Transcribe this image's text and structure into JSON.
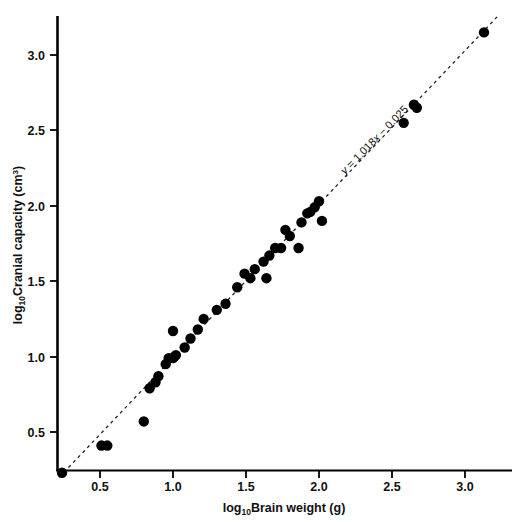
{
  "chart_data": {
    "type": "scatter",
    "title": "",
    "subtitle": "",
    "xlabel": "log10 Brain weight (g)",
    "xlabel_base": "log",
    "xlabel_sub": "10",
    "xlabel_rest": "Brain weight (g)",
    "ylabel": "log10 Cranial capacity (cm3)",
    "ylabel_base": "log",
    "ylabel_sub": "10",
    "ylabel_rest": "Cranial capacity (cm",
    "ylabel_sup": "3",
    "ylabel_tail": ")",
    "xlim": [
      0.2,
      3.25
    ],
    "ylim": [
      0.2,
      3.25
    ],
    "xticks": [
      0.5,
      1.0,
      1.5,
      2.0,
      2.5,
      3.0
    ],
    "xticklabels": [
      "0.5",
      "1.0",
      "1.5",
      "2.0",
      "2.5",
      "3.0"
    ],
    "yticks": [
      0.5,
      1.0,
      1.5,
      2.0,
      2.5,
      3.0
    ],
    "yticklabels": [
      "0.5",
      "1.0",
      "1.5",
      "2.0",
      "2.5",
      "3.0"
    ],
    "grid": false,
    "legend": null,
    "marker_color": "#000000",
    "marker_size": 5.2,
    "axis_color": "#000000",
    "fit_line": {
      "style": "dashed",
      "color": "#222222",
      "slope": 1.018,
      "intercept": -0.025,
      "annotation": "y = 1.018x − 0.025",
      "annotation_parts": {
        "y": "y",
        "equals": " = 1.018",
        "x": "x",
        "tail": " − 0.025"
      },
      "x_start": 0.22,
      "x_end": 3.23
    },
    "points": [
      {
        "x": 0.24,
        "y": 0.23
      },
      {
        "x": 0.51,
        "y": 0.41
      },
      {
        "x": 0.55,
        "y": 0.41
      },
      {
        "x": 0.8,
        "y": 0.57
      },
      {
        "x": 0.84,
        "y": 0.79
      },
      {
        "x": 0.88,
        "y": 0.83
      },
      {
        "x": 0.9,
        "y": 0.87
      },
      {
        "x": 0.95,
        "y": 0.95
      },
      {
        "x": 0.97,
        "y": 0.99
      },
      {
        "x": 1.0,
        "y": 0.99
      },
      {
        "x": 1.01,
        "y": 1.0
      },
      {
        "x": 1.02,
        "y": 1.01
      },
      {
        "x": 1.0,
        "y": 1.17
      },
      {
        "x": 1.08,
        "y": 1.06
      },
      {
        "x": 1.12,
        "y": 1.12
      },
      {
        "x": 1.17,
        "y": 1.18
      },
      {
        "x": 1.21,
        "y": 1.25
      },
      {
        "x": 1.3,
        "y": 1.31
      },
      {
        "x": 1.36,
        "y": 1.35
      },
      {
        "x": 1.44,
        "y": 1.46
      },
      {
        "x": 1.49,
        "y": 1.55
      },
      {
        "x": 1.53,
        "y": 1.52
      },
      {
        "x": 1.56,
        "y": 1.58
      },
      {
        "x": 1.62,
        "y": 1.63
      },
      {
        "x": 1.64,
        "y": 1.52
      },
      {
        "x": 1.66,
        "y": 1.67
      },
      {
        "x": 1.7,
        "y": 1.72
      },
      {
        "x": 1.74,
        "y": 1.72
      },
      {
        "x": 1.8,
        "y": 1.8
      },
      {
        "x": 1.77,
        "y": 1.84
      },
      {
        "x": 1.86,
        "y": 1.72
      },
      {
        "x": 1.88,
        "y": 1.89
      },
      {
        "x": 1.92,
        "y": 1.95
      },
      {
        "x": 1.94,
        "y": 1.96
      },
      {
        "x": 1.97,
        "y": 1.99
      },
      {
        "x": 2.0,
        "y": 2.03
      },
      {
        "x": 2.02,
        "y": 1.9
      },
      {
        "x": 2.58,
        "y": 2.55
      },
      {
        "x": 2.65,
        "y": 2.67
      },
      {
        "x": 2.67,
        "y": 2.65
      },
      {
        "x": 3.13,
        "y": 3.15
      }
    ]
  }
}
